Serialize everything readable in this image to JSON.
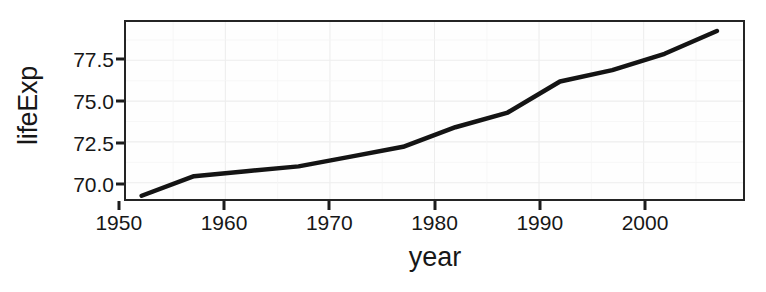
{
  "chart_data": {
    "type": "line",
    "title": "",
    "xlabel": "year",
    "ylabel": "lifeExp",
    "xlim": [
      1950.5,
      2009.5
    ],
    "ylim": [
      69.0,
      79.85
    ],
    "grid": true,
    "legend": "none",
    "x_ticks": [
      1950,
      1960,
      1970,
      1980,
      1990,
      2000
    ],
    "x_tick_labels": [
      "1950",
      "1960",
      "1970",
      "1980",
      "1990",
      "2000"
    ],
    "y_ticks": [
      70.0,
      72.5,
      75.0,
      77.5
    ],
    "y_tick_labels": [
      "70.0",
      "72.5",
      "75.0",
      "77.5"
    ],
    "series": [
      {
        "name": "lifeExp",
        "color": "#141414",
        "x": [
          1952,
          1957,
          1962,
          1967,
          1972,
          1977,
          1982,
          1987,
          1992,
          1997,
          2002,
          2007
        ],
        "values": [
          69.2,
          70.4,
          70.7,
          71.0,
          71.6,
          72.2,
          73.0,
          73.9,
          74.9,
          76.1,
          77.0,
          78.0
        ]
      }
    ],
    "points": [
      {
        "year": 1952,
        "lifeExp": 69.2
      },
      {
        "year": 1957,
        "lifeExp": 70.4
      },
      {
        "year": 1962,
        "lifeExp": 70.7
      },
      {
        "year": 1967,
        "lifeExp": 71.0
      },
      {
        "year": 1972,
        "lifeExp": 71.6
      },
      {
        "year": 1977,
        "lifeExp": 72.2
      },
      {
        "year": 1982,
        "lifeExp": 73.4
      },
      {
        "year": 1987,
        "lifeExp": 74.3
      },
      {
        "year": 1992,
        "lifeExp": 76.2
      },
      {
        "year": 1997,
        "lifeExp": 76.9
      },
      {
        "year": 2002,
        "lifeExp": 77.9
      },
      {
        "year": 2007,
        "lifeExp": 79.3
      }
    ]
  },
  "axes": {
    "x_title": "year",
    "y_title": "lifeExp"
  }
}
